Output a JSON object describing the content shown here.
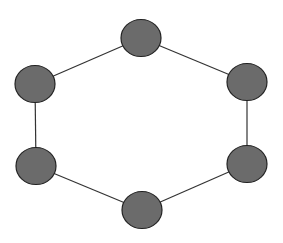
{
  "diagram": {
    "type": "cycle-graph",
    "width": 283,
    "height": 243,
    "colors": {
      "background": "#ffffff",
      "node_fill": "#6b6b6b",
      "node_stroke": "#222222",
      "edge_stroke": "#333333"
    },
    "node_radius": {
      "rx": 20,
      "ry": 18.5
    },
    "nodes": [
      {
        "id": "top",
        "cx": 141,
        "cy": 38
      },
      {
        "id": "upper-right",
        "cx": 247,
        "cy": 82
      },
      {
        "id": "lower-right",
        "cx": 247,
        "cy": 164
      },
      {
        "id": "bottom",
        "cx": 142,
        "cy": 210
      },
      {
        "id": "lower-left",
        "cx": 36,
        "cy": 166
      },
      {
        "id": "upper-left",
        "cx": 35,
        "cy": 84
      }
    ],
    "edges": [
      [
        "top",
        "upper-right"
      ],
      [
        "upper-right",
        "lower-right"
      ],
      [
        "lower-right",
        "bottom"
      ],
      [
        "bottom",
        "lower-left"
      ],
      [
        "lower-left",
        "upper-left"
      ],
      [
        "upper-left",
        "top"
      ]
    ]
  }
}
